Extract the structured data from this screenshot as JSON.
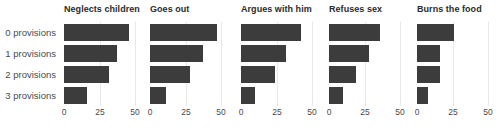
{
  "chart_data": {
    "type": "bar",
    "title": "",
    "orientation": "horizontal",
    "faceted": true,
    "xlabel": "",
    "ylabel": "",
    "xlim": [
      0,
      50
    ],
    "xticks": [
      0,
      25,
      50
    ],
    "xtick_labels": [
      "0",
      "25",
      "50"
    ],
    "grid": "vertical-light",
    "legend": "none",
    "bar_color": "#3c3c3c",
    "categories": [
      "0 provisions",
      "1 provisions",
      "2 provisions",
      "3 provisions"
    ],
    "panels": [
      {
        "title": "Neglects children",
        "values": [
          46,
          37,
          32,
          16
        ]
      },
      {
        "title": "Goes out",
        "values": [
          47,
          37,
          28,
          11
        ]
      },
      {
        "title": "Argues with him",
        "values": [
          42,
          32,
          24,
          10
        ]
      },
      {
        "title": "Refuses sex",
        "values": [
          36,
          28,
          19,
          10
        ]
      },
      {
        "title": "Burns the food",
        "values": [
          26,
          16,
          16,
          8
        ]
      }
    ]
  }
}
